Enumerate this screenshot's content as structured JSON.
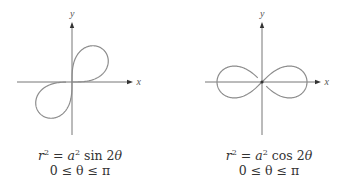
{
  "chart_data": [
    {
      "type": "line",
      "title": "Lemniscate r^2 = a^2 sin 2θ",
      "equation": "r² = a² sin 2θ",
      "domain": "0 ≤ θ ≤ π",
      "xlabel": "x",
      "ylabel": "y",
      "polar": {
        "kind": "sin",
        "a": 45
      },
      "origin_px": [
        72,
        82
      ],
      "x_axis_px": [
        17,
        133
      ],
      "y_axis_px": [
        23,
        135
      ],
      "grid": false
    },
    {
      "type": "line",
      "title": "Lemniscate r^2 = a^2 cos 2θ",
      "equation": "r² = a² cos 2θ",
      "domain": "0 ≤ θ ≤ π",
      "xlabel": "x",
      "ylabel": "y",
      "polar": {
        "kind": "cos",
        "a": 45
      },
      "origin_px": [
        262,
        82
      ],
      "x_axis_px": [
        205,
        321
      ],
      "y_axis_px": [
        23,
        135
      ],
      "grid": false
    }
  ],
  "figures": [
    {
      "caption_line1_pre": "r",
      "caption_line1_exp": "2",
      "caption_line1_eq": " = ",
      "caption_line1_a": "a",
      "caption_line1_exp2": "2",
      "caption_line1_fn": " sin 2",
      "caption_line1_theta": "θ",
      "caption_line2": "0 ≤ θ ≤ π",
      "x_label": "x",
      "y_label": "y"
    },
    {
      "caption_line1_pre": "r",
      "caption_line1_exp": "2",
      "caption_line1_eq": " = ",
      "caption_line1_a": "a",
      "caption_line1_exp2": "2",
      "caption_line1_fn": " cos 2",
      "caption_line1_theta": "θ",
      "caption_line2": "0 ≤ θ ≤ π",
      "x_label": "x",
      "y_label": "y"
    }
  ],
  "colors": {
    "curve": "#8c8c8c",
    "axis": "#666666",
    "arrow": "#333333",
    "text": "#333333"
  }
}
